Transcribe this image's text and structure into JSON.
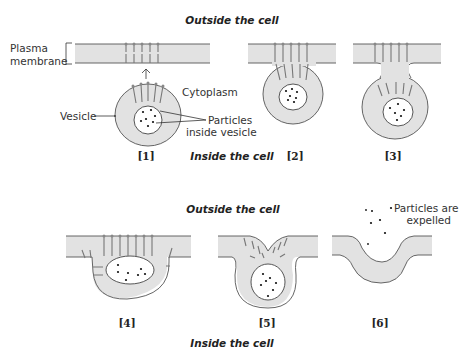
{
  "figure": {
    "row1": {
      "outside_label": "Outside the cell",
      "inside_label": "Inside the cell",
      "panels": [
        {
          "number": "[1]"
        },
        {
          "number": "[2]"
        },
        {
          "number": "[3]"
        }
      ],
      "annotations": {
        "plasma_membrane_line1": "Plasma",
        "plasma_membrane_line2": "membrane",
        "cytoplasm": "Cytoplasm",
        "vesicle": "Vesicle",
        "particles_line1": "Particles",
        "particles_line2": "inside vesicle"
      }
    },
    "row2": {
      "outside_label": "Outside the cell",
      "inside_label": "Inside the cell",
      "panels": [
        {
          "number": "[4]"
        },
        {
          "number": "[5]"
        },
        {
          "number": "[6]"
        }
      ],
      "annotations": {
        "expelled_line1": "Particles are",
        "expelled_line2": "expelled"
      }
    },
    "colors": {
      "membrane_fill": "#e2e2e2",
      "outline": "#555555",
      "background": "#ffffff"
    }
  }
}
